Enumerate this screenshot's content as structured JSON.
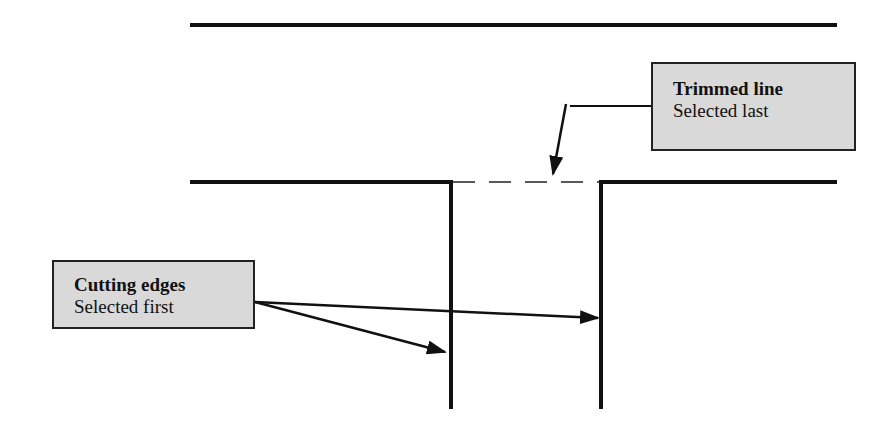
{
  "diagram": {
    "colors": {
      "line": "#111111",
      "callout_fill": "#d9d9d9",
      "callout_border": "#222222",
      "background": "#ffffff"
    },
    "callouts": [
      {
        "id": "trimmed-line",
        "title": "Trimmed line",
        "subtitle": "Selected last"
      },
      {
        "id": "cutting-edges",
        "title": "Cutting edges",
        "subtitle": "Selected first"
      }
    ],
    "geometry": {
      "top_line": {
        "x1": 190,
        "x2": 837,
        "y": 25
      },
      "middle_line_left": {
        "x1": 190,
        "x2": 452,
        "y": 182
      },
      "middle_line_right": {
        "x1": 599,
        "x2": 837,
        "y": 182
      },
      "trimmed_segment_dashed": {
        "x1": 452,
        "x2": 599,
        "y": 182
      },
      "cutting_edge_1": {
        "x": 451,
        "y1": 182,
        "y2": 408
      },
      "cutting_edge_2": {
        "x": 601,
        "y1": 182,
        "y2": 408
      }
    }
  }
}
